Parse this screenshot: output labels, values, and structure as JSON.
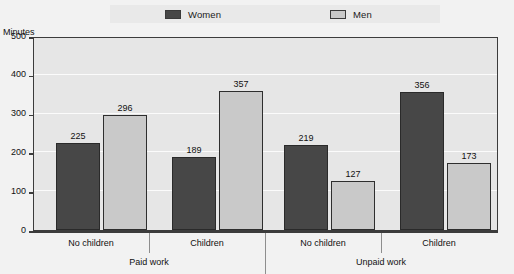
{
  "chart_data": {
    "type": "bar",
    "title": "",
    "xlabel": "",
    "ylabel": "Minutes",
    "ylim": [
      0,
      500
    ],
    "ytick_values": [
      0,
      100,
      200,
      300,
      400,
      500
    ],
    "ytick_labels": [
      "0",
      "100",
      "200",
      "300",
      "400",
      "500"
    ],
    "grid": "horizontal",
    "legend_position": "top-center",
    "categories": [
      "No children",
      "Children",
      "No children",
      "Children"
    ],
    "group_labels": [
      "Paid work",
      "Unpaid work"
    ],
    "series": [
      {
        "name": "Women",
        "color": "#474747",
        "values": [
          225,
          189,
          219,
          356
        ]
      },
      {
        "name": "Men",
        "color": "#c9c9c9",
        "values": [
          296,
          357,
          127,
          173
        ]
      }
    ],
    "groups": [
      {
        "group": "Paid work",
        "categories": [
          {
            "label": "No children",
            "Women": 225,
            "Men": 296
          },
          {
            "label": "Children",
            "Women": 189,
            "Men": 357
          }
        ]
      },
      {
        "group": "Unpaid work",
        "categories": [
          {
            "label": "No children",
            "Women": 219,
            "Men": 127
          },
          {
            "label": "Children",
            "Women": 356,
            "Men": 173
          }
        ]
      }
    ]
  },
  "legend": {
    "women_label": "Women",
    "men_label": "Men",
    "women_swatch_icon": "dark-gray-square-icon",
    "men_swatch_icon": "light-gray-square-icon"
  },
  "axes": {
    "y_title": "Minutes",
    "y_ticks": [
      "500",
      "400",
      "300",
      "200",
      "100",
      "0"
    ],
    "category_labels": [
      "No children",
      "Children",
      "No children",
      "Children"
    ],
    "group_labels": [
      "Paid work",
      "Unpaid work"
    ]
  },
  "bar_value_labels": [
    "225",
    "296",
    "189",
    "357",
    "219",
    "127",
    "356",
    "173"
  ],
  "colors": {
    "women": "#474747",
    "men": "#c9c9c9",
    "plot_background": "#e6e6e6",
    "plot_border": "#3c3c3c",
    "page_background": "#f2f2f2",
    "gridline": "#fbfbfb"
  }
}
